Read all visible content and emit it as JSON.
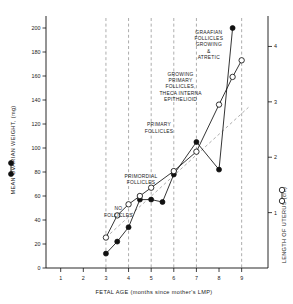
{
  "chart_data": {
    "type": "line",
    "title": "",
    "xlabel": "FETAL AGE (months since mother's LMP)",
    "ylabel": "MEAN OVARIAN WEIGHT, (mg)",
    "y2label": "LENGTH OF UTERUS (cm)",
    "xlim": [
      0.35,
      9.9
    ],
    "ylim": [
      0,
      210
    ],
    "y2lim": [
      0,
      4.55
    ],
    "xticks": [
      1,
      2,
      3,
      4,
      5,
      6,
      7,
      8,
      9
    ],
    "xtick_labels": [
      "1",
      "2",
      "3",
      "4",
      "5",
      "6",
      "7",
      "8",
      "9"
    ],
    "yticks": [
      0,
      20,
      40,
      60,
      80,
      100,
      120,
      140,
      160,
      180,
      200
    ],
    "ytick_labels": [
      "0",
      "20",
      "40",
      "60",
      "80",
      "100",
      "120",
      "140",
      "160",
      "180",
      "200"
    ],
    "y2ticks": [
      1,
      2,
      3,
      4
    ],
    "y2tick_labels": [
      "1",
      "2",
      "3",
      "4"
    ],
    "grid": false,
    "vertical_dividers": [
      3.0,
      4.0,
      5.0,
      6.0,
      7.0,
      9.0
    ],
    "legend": [
      {
        "name": "MEAN OVARIAN WEIGHT, (mg)",
        "marker": "filled-circle",
        "axis": "left"
      },
      {
        "name": "LENGTH OF UTERUS (cm)",
        "marker": "open-circle",
        "axis": "right"
      }
    ],
    "series": [
      {
        "name": "MEAN OVARIAN WEIGHT, (mg)",
        "marker": "filled-circle",
        "axis": "left",
        "x": [
          3.0,
          3.5,
          4.0,
          4.5,
          5.0,
          5.5,
          6.0,
          7.0,
          8.0,
          8.6
        ],
        "values": [
          12,
          22,
          34,
          57,
          57,
          55,
          78,
          105,
          82,
          200
        ]
      },
      {
        "name": "LENGTH OF UTERUS (cm)",
        "marker": "open-circle",
        "axis": "right",
        "x": [
          3.0,
          3.5,
          4.0,
          4.5,
          5.0,
          6.0,
          7.0,
          8.0,
          8.6,
          9.0
        ],
        "values": [
          0.55,
          0.95,
          1.15,
          1.3,
          1.45,
          1.75,
          2.1,
          2.95,
          3.45,
          3.75
        ]
      }
    ],
    "trend_reference": {
      "name": "uterus-linear-trend",
      "style": "dashed",
      "x": [
        3.0,
        9.3
      ],
      "values": [
        0.55,
        2.9
      ]
    },
    "annotations": [
      {
        "id": "no-follicles",
        "text": [
          "NO",
          "FOLLICLES"
        ],
        "x": 3.55,
        "y": 48
      },
      {
        "id": "primordial-follicles",
        "text": [
          "PRIMORDIAL",
          "FOLLICLES"
        ],
        "x": 4.55,
        "y": 75
      },
      {
        "id": "primary-follicles",
        "text": [
          "PRIMARY",
          "FOLLICLES"
        ],
        "x": 5.35,
        "y": 118
      },
      {
        "id": "growing-primary-follicles",
        "text": [
          "GROWING",
          "PRIMARY",
          "FOLLICLES,",
          "THECA  INTERNA",
          "EPITHELIOID"
        ],
        "x": 6.3,
        "y": 160
      },
      {
        "id": "graafian-follicles",
        "text": [
          "GRAAFIAN",
          "FOLLICLES",
          "GROWING",
          "&",
          "ATRETIC"
        ],
        "x": 7.55,
        "y": 195
      }
    ]
  }
}
